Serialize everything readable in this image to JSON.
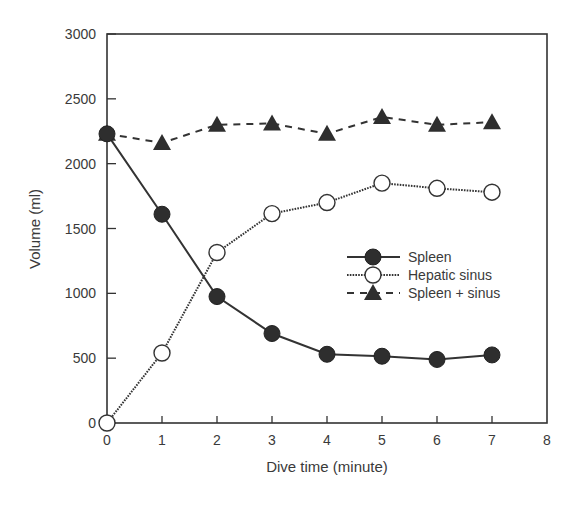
{
  "chart_data": {
    "type": "line",
    "title": "",
    "xlabel": "Dive time (minute)",
    "ylabel": "Volume (ml)",
    "x": [
      0,
      1,
      2,
      3,
      4,
      5,
      6,
      7
    ],
    "xlim": [
      0,
      8
    ],
    "ylim": [
      0,
      3000
    ],
    "xticks": [
      "0",
      "1",
      "2",
      "3",
      "4",
      "5",
      "6",
      "7",
      "8"
    ],
    "yticks": [
      "0",
      "500",
      "1000",
      "1500",
      "2000",
      "2500",
      "3000"
    ],
    "grid": false,
    "legend_position": "center-right",
    "series": [
      {
        "name": "Spleen",
        "marker": "filled-circle",
        "line": "solid",
        "values": [
          2230,
          1610,
          975,
          690,
          530,
          515,
          490,
          525
        ]
      },
      {
        "name": "Hepatic sinus",
        "marker": "open-circle",
        "line": "dotted",
        "values": [
          0,
          540,
          1315,
          1615,
          1700,
          1850,
          1810,
          1780
        ]
      },
      {
        "name": "Spleen + sinus",
        "marker": "filled-triangle",
        "line": "dashed",
        "values": [
          2230,
          2160,
          2300,
          2310,
          2230,
          2360,
          2300,
          2320
        ]
      }
    ]
  },
  "legend": {
    "items": [
      {
        "label": "Spleen"
      },
      {
        "label": "Hepatic sinus"
      },
      {
        "label": "Spleen + sinus"
      }
    ]
  },
  "colors": {
    "ink": "#333333",
    "marker_fill": "#2e2e2e",
    "open_fill": "#ffffff"
  }
}
